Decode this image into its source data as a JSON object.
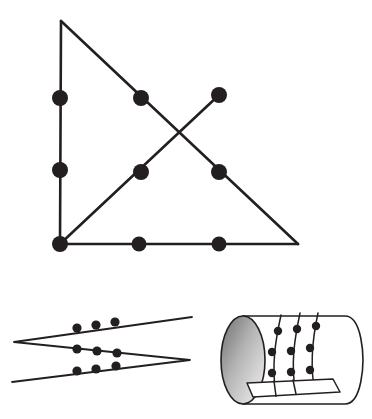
{
  "document": {
    "title": "Geometric figure plate",
    "background_color": "#ffffff",
    "ink_color": "#231f20",
    "width": 372,
    "height": 419
  },
  "figures": [
    {
      "id": "triangle-figure",
      "name": "right-triangle-with-crossing-chord",
      "description": "Right triangle with vertical left leg, horizontal bottom leg and hypotenuse, plus a crossing segment from the bottom-left vertex to a free endpoint at upper right; eight marked points",
      "vertices": {
        "apex": {
          "x": 61,
          "y": 21
        },
        "bottom_left": {
          "x": 60,
          "y": 244
        },
        "bottom_right": {
          "x": 298,
          "y": 244
        }
      },
      "segments": [
        {
          "name": "left-leg",
          "x1": 61,
          "y1": 21,
          "x2": 60,
          "y2": 244,
          "width": 2.6
        },
        {
          "name": "bottom-leg",
          "x1": 60,
          "y1": 244,
          "x2": 298,
          "y2": 244,
          "width": 2.6
        },
        {
          "name": "hypotenuse",
          "x1": 61,
          "y1": 21,
          "x2": 298,
          "y2": 244,
          "width": 2.6
        },
        {
          "name": "crossing-chord",
          "x1": 60,
          "y1": 244,
          "x2": 219,
          "y2": 95,
          "width": 2.6
        }
      ],
      "crossing_point": {
        "x": 178,
        "y": 130
      },
      "dots": [
        {
          "name": "left-leg-upper-dot",
          "x": 60,
          "y": 98,
          "r": 8
        },
        {
          "name": "left-leg-lower-dot",
          "x": 60,
          "y": 170,
          "r": 8
        },
        {
          "name": "hypotenuse-upper-dot",
          "x": 141,
          "y": 98,
          "r": 8
        },
        {
          "name": "chord-endpoint-dot",
          "x": 219,
          "y": 95,
          "r": 8
        },
        {
          "name": "chord-middle-dot",
          "x": 141,
          "y": 172,
          "r": 8
        },
        {
          "name": "hypotenuse-lower-dot",
          "x": 219,
          "y": 172,
          "r": 8
        },
        {
          "name": "bottom-left-vertex-dot",
          "x": 60,
          "y": 244,
          "r": 8
        },
        {
          "name": "bottom-leg-left-dot",
          "x": 139,
          "y": 244,
          "r": 7.5
        },
        {
          "name": "bottom-leg-right-dot",
          "x": 219,
          "y": 244,
          "r": 7.5
        }
      ]
    },
    {
      "id": "zigzag-figure",
      "name": "three-strand-zigzag-with-dots",
      "description": "A zigzag of three nearly-parallel long strands meeting at a left cusp and a right cusp, each strand carrying three marked points",
      "polyline": [
        {
          "x": 192,
          "y": 317
        },
        {
          "x": 14,
          "y": 342
        },
        {
          "x": 190,
          "y": 360
        },
        {
          "x": 12,
          "y": 382
        }
      ],
      "stroke_width": 1.8,
      "dots": [
        {
          "name": "strand1-dot-1",
          "x": 77,
          "y": 328,
          "r": 4.6
        },
        {
          "name": "strand1-dot-2",
          "x": 96,
          "y": 325,
          "r": 4.6
        },
        {
          "name": "strand1-dot-3",
          "x": 115,
          "y": 322,
          "r": 4.6
        },
        {
          "name": "strand2-dot-1",
          "x": 77,
          "y": 349,
          "r": 4.6
        },
        {
          "name": "strand2-dot-2",
          "x": 97,
          "y": 351,
          "r": 4.6
        },
        {
          "name": "strand2-dot-3",
          "x": 117,
          "y": 353,
          "r": 4.6
        },
        {
          "name": "strand3-dot-1",
          "x": 77,
          "y": 371,
          "r": 4.6
        },
        {
          "name": "strand3-dot-2",
          "x": 96,
          "y": 369,
          "r": 4.6
        },
        {
          "name": "strand3-dot-3",
          "x": 116,
          "y": 366,
          "r": 4.6
        }
      ]
    },
    {
      "id": "cylinder-figure",
      "name": "shaded-cylinder-with-three-threads",
      "description": "A horizontal cylinder drawn in perspective with a shaded elliptical left cap, a rounded right end, a flat quadrilateral band across the lower front, and three curved threads each carrying three marked points",
      "left_cap": {
        "cx": 243,
        "cy": 360,
        "rx": 22,
        "ry": 44
      },
      "cap_shading": {
        "from": "#6e6e6e",
        "to": "#f4f4f4"
      },
      "body": {
        "left_x": 243,
        "right_x": 345,
        "top_y": 316,
        "bottom_y": 404,
        "right_rx": 18
      },
      "threads": [
        {
          "name": "thread-left",
          "path": "M 281 315 C 276 338, 271 364, 276 396",
          "dots": [
            {
              "name": "thread-left-dot-1",
              "x": 278,
              "y": 331,
              "r": 4.2
            },
            {
              "name": "thread-left-dot-2",
              "x": 272,
              "y": 352,
              "r": 4.2
            },
            {
              "name": "thread-left-dot-3",
              "x": 272,
              "y": 373,
              "r": 4.2
            }
          ]
        },
        {
          "name": "thread-middle",
          "path": "M 300 313 C 295 337, 290 364, 296 394",
          "dots": [
            {
              "name": "thread-middle-dot-1",
              "x": 297,
              "y": 329,
              "r": 4.2
            },
            {
              "name": "thread-middle-dot-2",
              "x": 291,
              "y": 351,
              "r": 4.2
            },
            {
              "name": "thread-middle-dot-3",
              "x": 291,
              "y": 372,
              "r": 4.2
            }
          ]
        },
        {
          "name": "thread-right",
          "path": "M 318 313 C 313 336, 309 363, 315 392",
          "dots": [
            {
              "name": "thread-right-dot-1",
              "x": 316,
              "y": 326,
              "r": 4.2
            },
            {
              "name": "thread-right-dot-2",
              "x": 310,
              "y": 348,
              "r": 4.2
            },
            {
              "name": "thread-right-dot-3",
              "x": 310,
              "y": 370,
              "r": 4.2
            }
          ]
        }
      ],
      "front_band": {
        "name": "lower-front-band",
        "path": "M 247 383 L 333 379 L 340 392 L 253 397 Z"
      }
    }
  ]
}
